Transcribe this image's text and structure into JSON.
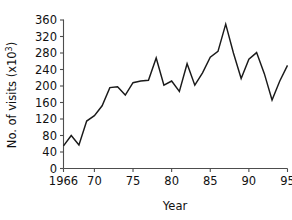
{
  "chart_data": {
    "type": "line",
    "title": "",
    "xlabel": "Year",
    "ylabel": "No. of visits (x10",
    "ylabel_sup": "3",
    "ylabel_suffix": ")",
    "x": [
      1966,
      1967,
      1968,
      1969,
      1970,
      1971,
      1972,
      1973,
      1974,
      1975,
      1976,
      1977,
      1978,
      1979,
      1980,
      1981,
      1982,
      1983,
      1984,
      1985,
      1986,
      1987,
      1988,
      1989,
      1990,
      1991,
      1992,
      1993,
      1994,
      1995
    ],
    "values": [
      55,
      80,
      57,
      115,
      128,
      152,
      196,
      198,
      178,
      208,
      212,
      214,
      268,
      202,
      212,
      187,
      254,
      202,
      232,
      270,
      284,
      350,
      280,
      218,
      265,
      281,
      230,
      166,
      212,
      250
    ],
    "xlim": [
      1966,
      1995
    ],
    "ylim": [
      0,
      360
    ],
    "yticks": [
      0,
      40,
      80,
      120,
      160,
      200,
      240,
      280,
      320,
      360
    ],
    "ytick_labels": [
      "0",
      "40",
      "80",
      "120",
      "160",
      "200",
      "240",
      "280",
      "320",
      "360"
    ],
    "xticks": [
      1966,
      1970,
      1975,
      1980,
      1985,
      1990,
      1995
    ],
    "xtick_labels": [
      "1966",
      "70",
      "75",
      "80",
      "85",
      "90",
      "95"
    ],
    "grid": false,
    "legend": false,
    "line_color": "#1a1a1a",
    "axis_color": "#4d4d4d",
    "background_color": "#ffffff"
  }
}
